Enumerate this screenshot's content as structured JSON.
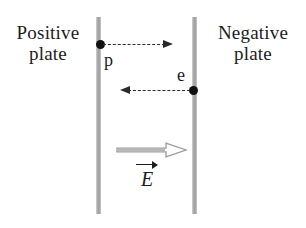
{
  "figure": {
    "background_color": "#ffffff",
    "width": 306,
    "height": 228
  },
  "plates": {
    "left": {
      "label_line1": "Positive",
      "label_line2": "plate",
      "charge_sign": "+",
      "color": "#a9a9a9"
    },
    "right": {
      "label_line1": "Negative",
      "label_line2": "plate",
      "charge_sign": "−",
      "color": "#a9a9a9"
    }
  },
  "particles": [
    {
      "id": "proton",
      "label": "p",
      "starts_at_plate": "left",
      "motion_direction": "right",
      "dot_color": "#111111",
      "arrow_style": "dashed"
    },
    {
      "id": "electron",
      "label": "e",
      "starts_at_plate": "right",
      "motion_direction": "left",
      "dot_color": "#111111",
      "arrow_style": "dashed"
    }
  ],
  "field": {
    "symbol": "E",
    "vector_notation": "arrow-overbar",
    "direction": "right",
    "arrow_style": "hollow-outline",
    "arrow_color": "#9a9a9a"
  }
}
